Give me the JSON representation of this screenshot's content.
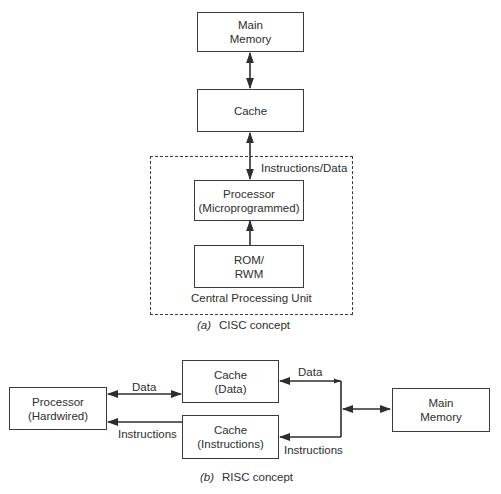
{
  "cisc": {
    "main_memory": {
      "line1": "Main",
      "line2": "Memory"
    },
    "cache": {
      "line1": "Cache"
    },
    "bus_label": "Instructions/Data",
    "processor": {
      "line1": "Processor",
      "line2": "(Microprogrammed)"
    },
    "rom": {
      "line1": "ROM/",
      "line2": "RWM"
    },
    "cpu_label": "Central Processing Unit",
    "caption": {
      "tag": "(a)",
      "text": "CISC concept"
    }
  },
  "risc": {
    "processor": {
      "line1": "Processor",
      "line2": "(Hardwired)"
    },
    "cache_data": {
      "line1": "Cache",
      "line2": "(Data)"
    },
    "cache_instructions": {
      "line1": "Cache",
      "line2": "(Instructions)"
    },
    "main_memory": {
      "line1": "Main",
      "line2": "Memory"
    },
    "data_label_left": "Data",
    "instructions_label_left": "Instructions",
    "data_label_right": "Data",
    "instructions_label_right": "Instructions",
    "caption": {
      "tag": "(b)",
      "text": "RISC concept"
    }
  },
  "colors": {
    "line": "#2e2e2e",
    "background": "#ffffff"
  }
}
